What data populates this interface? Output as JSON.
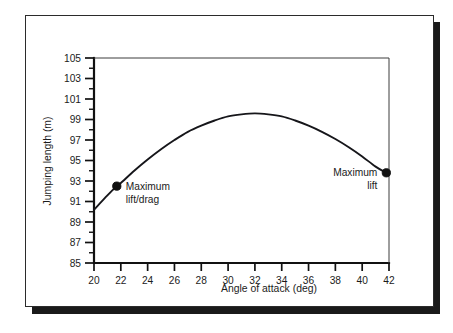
{
  "chart_data": {
    "type": "line",
    "title": "",
    "xlabel": "Angle of attack (deg)",
    "ylabel": "Jumping length (m)",
    "xlim": [
      20,
      42
    ],
    "ylim": [
      85,
      105
    ],
    "grid": false,
    "legend": "none",
    "x_ticks": [
      20,
      22,
      24,
      26,
      28,
      30,
      32,
      34,
      36,
      38,
      40,
      42
    ],
    "x_tick_labels": [
      "20",
      "22",
      "24",
      "26",
      "28",
      "30",
      "32",
      "34",
      "36",
      "38",
      "40",
      "42"
    ],
    "x_minor_ticks": [
      21,
      23,
      25,
      27,
      29,
      31,
      33,
      35,
      37,
      39,
      41
    ],
    "y_ticks": [
      85,
      87,
      89,
      91,
      93,
      95,
      97,
      99,
      101,
      103,
      105
    ],
    "y_tick_labels": [
      "85",
      "87",
      "89",
      "91",
      "93",
      "95",
      "97",
      "99",
      "101",
      "103",
      "105"
    ],
    "y_minor_ticks": [
      86,
      88,
      90,
      92,
      94,
      96,
      98,
      100,
      102,
      104
    ],
    "series": [
      {
        "name": "Jumping length vs angle of attack",
        "x": [
          20.0,
          21.0,
          21.7,
          22.0,
          23.0,
          24.0,
          25.0,
          26.0,
          27.0,
          28.0,
          29.0,
          30.0,
          31.0,
          32.0,
          33.0,
          34.0,
          35.0,
          36.0,
          37.0,
          38.0,
          39.0,
          40.0,
          41.0,
          41.8,
          42.0
        ],
        "y": [
          90.2,
          91.6,
          92.5,
          92.8,
          94.0,
          95.1,
          96.1,
          97.0,
          97.8,
          98.4,
          98.9,
          99.3,
          99.5,
          99.6,
          99.5,
          99.3,
          98.9,
          98.4,
          97.8,
          97.1,
          96.3,
          95.4,
          94.4,
          93.8,
          93.6
        ]
      }
    ],
    "annotations": [
      {
        "label": "Maximum lift/drag",
        "label_line_1": "Maximum",
        "label_line_2": "lift/drag",
        "point_x": 21.7,
        "point_y": 92.5,
        "marker": "filled-circle"
      },
      {
        "label": "Maximum lift",
        "label_line_1": "Maximum",
        "label_line_2": "lift",
        "point_x": 41.8,
        "point_y": 93.8,
        "marker": "filled-circle"
      }
    ]
  },
  "figure": {
    "frame_color": "#2b2b2b",
    "curve_color": "#16161a",
    "marker_color": "#101010",
    "background_color": "#ffffff"
  }
}
